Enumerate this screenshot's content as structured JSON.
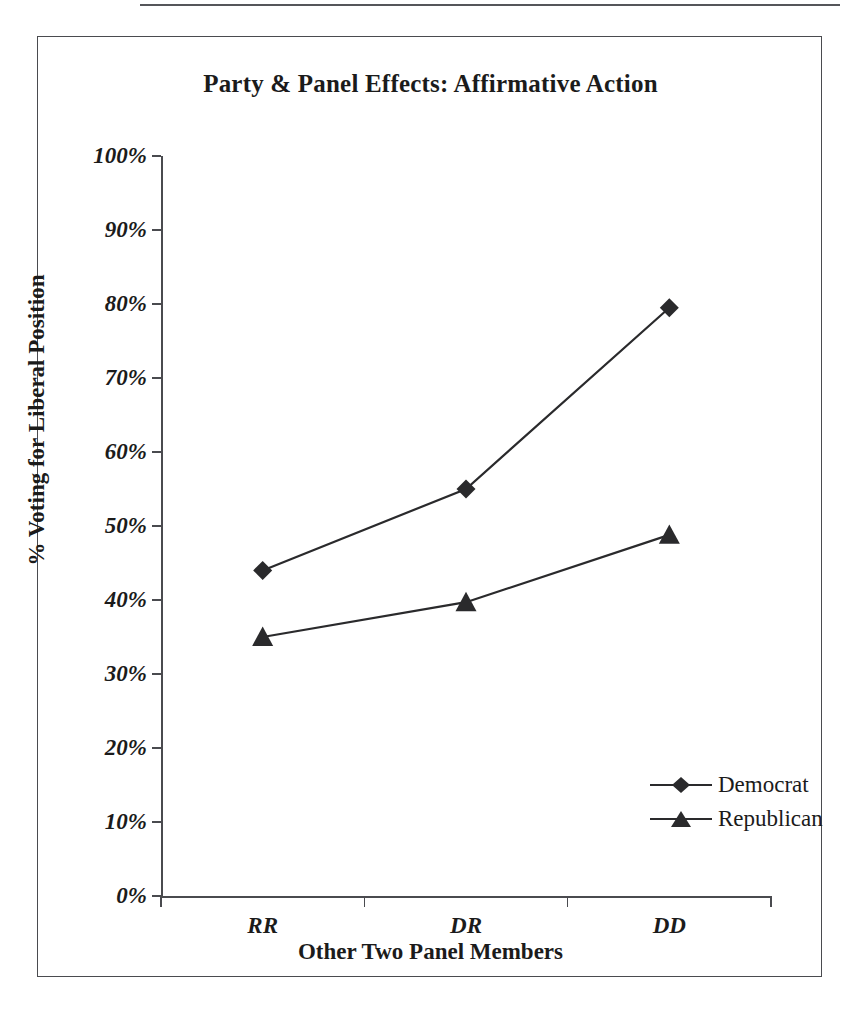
{
  "figure": {
    "title": "Party & Panel Effects: Affirmative Action",
    "frame_color": "#4a4b4f",
    "rule_color": "#55565a",
    "ink_color": "#2a2a2c"
  },
  "chart_data": {
    "type": "line",
    "title": "Party & Panel Effects: Affirmative Action",
    "xlabel": "Other Two Panel Members",
    "ylabel": "% Voting for Liberal Position",
    "categories": [
      "RR",
      "DR",
      "DD"
    ],
    "ylim": [
      0,
      100
    ],
    "yticks": [
      0,
      10,
      20,
      30,
      40,
      50,
      60,
      70,
      80,
      90,
      100
    ],
    "ytick_labels": [
      "0%",
      "10%",
      "20%",
      "30%",
      "40%",
      "50%",
      "60%",
      "70%",
      "80%",
      "90%",
      "100%"
    ],
    "grid": false,
    "legend_position": "inside-lower-right",
    "series": [
      {
        "name": "Democrat",
        "marker": "diamond",
        "values": [
          44.0,
          55.0,
          79.5
        ]
      },
      {
        "name": "Republican",
        "marker": "triangle",
        "values": [
          35.0,
          39.7,
          48.8
        ]
      }
    ]
  },
  "axis": {
    "y_labels": [
      "100%",
      "90%",
      "80%",
      "70%",
      "60%",
      "50%",
      "40%",
      "30%",
      "20%",
      "10%",
      "0%"
    ],
    "x_labels": [
      "RR",
      "DR",
      "DD"
    ],
    "x_title": "Other Two Panel Members",
    "y_title": "% Voting for Liberal Position"
  },
  "legend": {
    "items": [
      {
        "label": "Democrat",
        "marker": "diamond-marker"
      },
      {
        "label": "Republican",
        "marker": "triangle-marker"
      }
    ]
  }
}
